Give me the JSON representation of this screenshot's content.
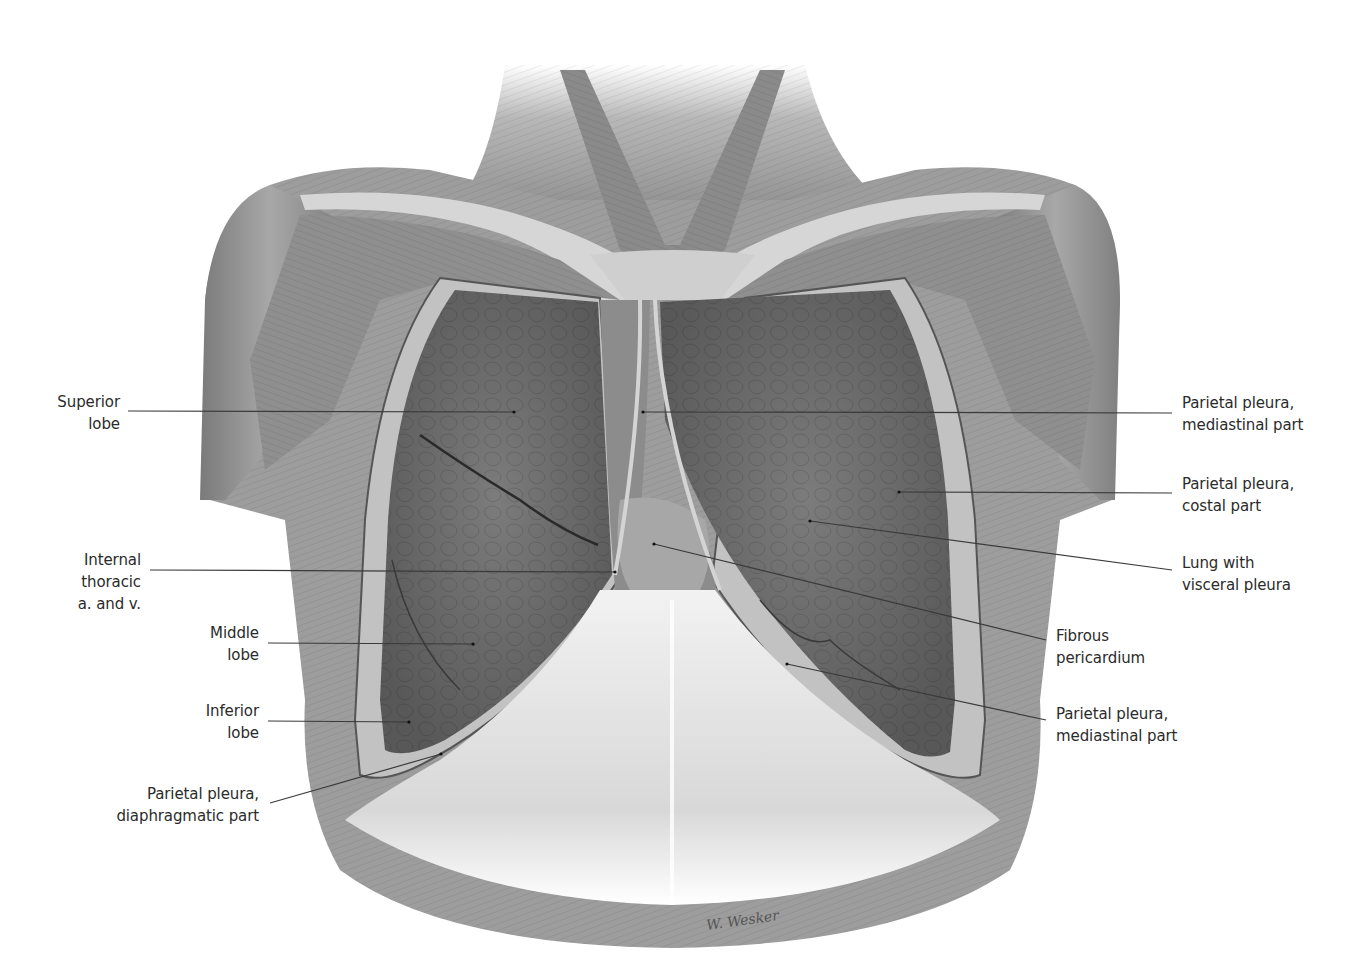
{
  "figure": {
    "signature": "W. Wesker"
  },
  "labels": [
    {
      "id": "superior-lobe",
      "side": "left",
      "lines": [
        "Superior",
        "lobe"
      ],
      "x": 120,
      "y": 401,
      "anchor": {
        "x": 128,
        "y": 411
      },
      "target": {
        "x": 514,
        "y": 412
      }
    },
    {
      "id": "internal-thoracic",
      "side": "left",
      "lines": [
        "Internal",
        "thoracic",
        "a. and v."
      ],
      "x": 141,
      "y": 559,
      "anchor": {
        "x": 150,
        "y": 570
      },
      "target": {
        "x": 615,
        "y": 572
      }
    },
    {
      "id": "middle-lobe",
      "side": "left",
      "lines": [
        "Middle",
        "lobe"
      ],
      "x": 259,
      "y": 632,
      "anchor": {
        "x": 268,
        "y": 643
      },
      "target": {
        "x": 473,
        "y": 644
      }
    },
    {
      "id": "inferior-lobe",
      "side": "left",
      "lines": [
        "Inferior",
        "lobe"
      ],
      "x": 259,
      "y": 710,
      "anchor": {
        "x": 268,
        "y": 721
      },
      "target": {
        "x": 409,
        "y": 722
      }
    },
    {
      "id": "parietal-pleura-diaphragmatic",
      "side": "left",
      "lines": [
        "Parietal pleura,",
        "diaphragmatic part"
      ],
      "x": 259,
      "y": 793,
      "anchor": {
        "x": 270,
        "y": 803
      },
      "target": {
        "x": 441,
        "y": 754
      }
    },
    {
      "id": "parietal-pleura-mediastinal-upper",
      "side": "right",
      "lines": [
        "Parietal pleura,",
        "mediastinal part"
      ],
      "x": 1182,
      "y": 402,
      "anchor": {
        "x": 1172,
        "y": 413
      },
      "target": {
        "x": 643,
        "y": 412
      }
    },
    {
      "id": "parietal-pleura-costal",
      "side": "right",
      "lines": [
        "Parietal pleura,",
        "costal part"
      ],
      "x": 1182,
      "y": 483,
      "anchor": {
        "x": 1172,
        "y": 493
      },
      "target": {
        "x": 899,
        "y": 492
      }
    },
    {
      "id": "lung-visceral-pleura",
      "side": "right",
      "lines": [
        "Lung with",
        "visceral pleura"
      ],
      "x": 1182,
      "y": 562,
      "anchor": {
        "x": 1172,
        "y": 570
      },
      "target": {
        "x": 810,
        "y": 521
      }
    },
    {
      "id": "fibrous-pericardium",
      "side": "right",
      "lines": [
        "Fibrous",
        "pericardium"
      ],
      "x": 1056,
      "y": 635,
      "anchor": {
        "x": 1046,
        "y": 640
      },
      "target": {
        "x": 654,
        "y": 544
      }
    },
    {
      "id": "parietal-pleura-mediastinal-lower",
      "side": "right",
      "lines": [
        "Parietal pleura,",
        "mediastinal part"
      ],
      "x": 1056,
      "y": 713,
      "anchor": {
        "x": 1046,
        "y": 720
      },
      "target": {
        "x": 787,
        "y": 664
      }
    }
  ],
  "colors": {
    "muscle": "#9a9a9a",
    "muscle_dark": "#6f6f6f",
    "tendon": "#d9d9d9",
    "lung": "#6e6e6e",
    "lung_dark": "#555555",
    "pleura": "#b5b5b5",
    "diaphragm": "#e6e6e6",
    "leader": "#3a3a3a",
    "text": "#2b2b2b"
  }
}
